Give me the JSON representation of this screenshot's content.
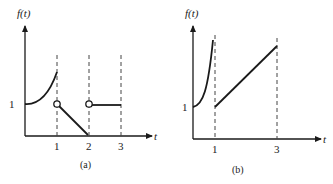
{
  "figure": {
    "panels": [
      {
        "id": "a",
        "caption": "(a)",
        "ylabel": "f(t)",
        "xlabel": "t",
        "ytick": "1",
        "xticks": [
          "1",
          "2",
          "3"
        ],
        "description": "Piecewise function: increasing curve from f=1 at t=0 to t=1 (closed end), open circle at (1,1), linear decrease to 0 at t=2, open circle at (2,1), constant 1 from t=2 to t=3"
      },
      {
        "id": "b",
        "caption": "(b)",
        "ylabel": "f(t)",
        "xlabel": "t",
        "ytick": "1",
        "xticks": [
          "1",
          "3"
        ],
        "description": "Curve from f=1 at t=0 rising steeply toward vertical asymptote at t=1; linear increase from f=1 at t=1 to t=3"
      }
    ],
    "colors": {
      "stroke": "#1a1a1a",
      "dashed": "#444444",
      "background": "#ffffff"
    }
  }
}
